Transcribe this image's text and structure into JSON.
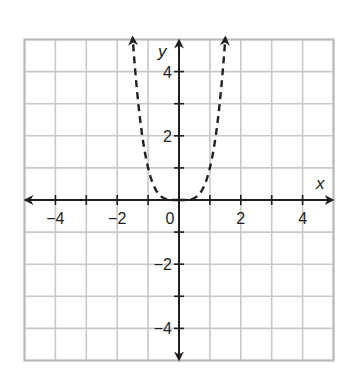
{
  "chart_data": {
    "type": "line",
    "title": "",
    "xlabel": "x",
    "ylabel": "y",
    "xlim": [
      -5,
      5
    ],
    "ylim": [
      -5,
      5
    ],
    "grid": true,
    "x_tick_labels": [
      {
        "value": -4,
        "label": "−4"
      },
      {
        "value": -2,
        "label": "−2"
      },
      {
        "value": 0,
        "label": "0"
      },
      {
        "value": 2,
        "label": "2"
      },
      {
        "value": 4,
        "label": "4"
      }
    ],
    "y_tick_labels": [
      {
        "value": 4,
        "label": "4"
      },
      {
        "value": 2,
        "label": "2"
      },
      {
        "value": -2,
        "label": "−2"
      },
      {
        "value": -4,
        "label": "−4"
      }
    ],
    "series": [
      {
        "name": "y = x^4",
        "style": "dashed",
        "color": "#231f20",
        "arrows_at_ends": true,
        "x": [
          -1.5,
          -1.4,
          -1.3,
          -1.2,
          -1.1,
          -1.0,
          -0.9,
          -0.8,
          -0.7,
          -0.6,
          -0.5,
          -0.4,
          -0.3,
          -0.2,
          -0.1,
          0,
          0.1,
          0.2,
          0.3,
          0.4,
          0.5,
          0.6,
          0.7,
          0.8,
          0.9,
          1.0,
          1.1,
          1.2,
          1.3,
          1.4,
          1.5
        ],
        "y": [
          5.06,
          3.84,
          2.86,
          2.07,
          1.46,
          1.0,
          0.66,
          0.41,
          0.24,
          0.13,
          0.06,
          0.03,
          0.01,
          0.0,
          0.0,
          0,
          0.0,
          0.0,
          0.01,
          0.03,
          0.06,
          0.13,
          0.24,
          0.41,
          0.66,
          1.0,
          1.46,
          2.07,
          2.86,
          3.84,
          5.06
        ]
      }
    ],
    "colors": {
      "grid": "#c8c8c8",
      "axis": "#231f20",
      "curve": "#231f20"
    }
  }
}
